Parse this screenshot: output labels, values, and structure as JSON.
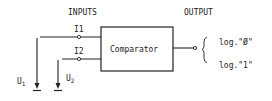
{
  "diagram": {
    "type": "comparator-block-diagram",
    "inputs_label": "INPUTS",
    "output_label": "OUTPUT",
    "block": {
      "label": "Comparator"
    },
    "terminals": {
      "i1": "I1",
      "i2": "I2"
    },
    "sources": {
      "u1": {
        "main": "U",
        "sub": "1"
      },
      "u2": {
        "main": "U",
        "sub": "2"
      }
    },
    "output_states": [
      "log.\"Ø\"",
      "log.\"1\""
    ],
    "colors": {
      "stroke": "#222222",
      "background": "#ffffff"
    }
  }
}
